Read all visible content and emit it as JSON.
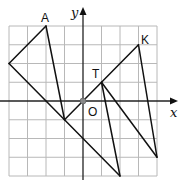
{
  "diagram": {
    "type": "coordinate-grid-geometry",
    "grid": {
      "x_range": [
        -4,
        4
      ],
      "y_range": [
        -4,
        4
      ],
      "cell_px": 18.5,
      "origin_px": [
        83,
        101
      ]
    },
    "axes": {
      "x_label": "x",
      "y_label": "y",
      "origin_label": "O"
    },
    "points": [
      {
        "name": "A",
        "label": "A",
        "x": -2,
        "y": 4
      },
      {
        "name": "L",
        "label": "",
        "x": -4,
        "y": 2
      },
      {
        "name": "P",
        "label": "",
        "x": -1,
        "y": -1
      },
      {
        "name": "R",
        "label": "",
        "x": 2,
        "y": -4
      },
      {
        "name": "T",
        "label": "T",
        "x": 1,
        "y": 1
      },
      {
        "name": "K",
        "label": "K",
        "x": 3,
        "y": 3
      },
      {
        "name": "Q",
        "label": "",
        "x": 4,
        "y": -3
      }
    ],
    "segments": [
      [
        "A",
        "L"
      ],
      [
        "A",
        "P"
      ],
      [
        "L",
        "R"
      ],
      [
        "P",
        "K"
      ],
      [
        "T",
        "R"
      ],
      [
        "K",
        "Q"
      ],
      [
        "T",
        "Q"
      ]
    ],
    "colors": {
      "line": "#111111",
      "grid": "#b8b8b8",
      "origin_dot": "#888888"
    }
  }
}
